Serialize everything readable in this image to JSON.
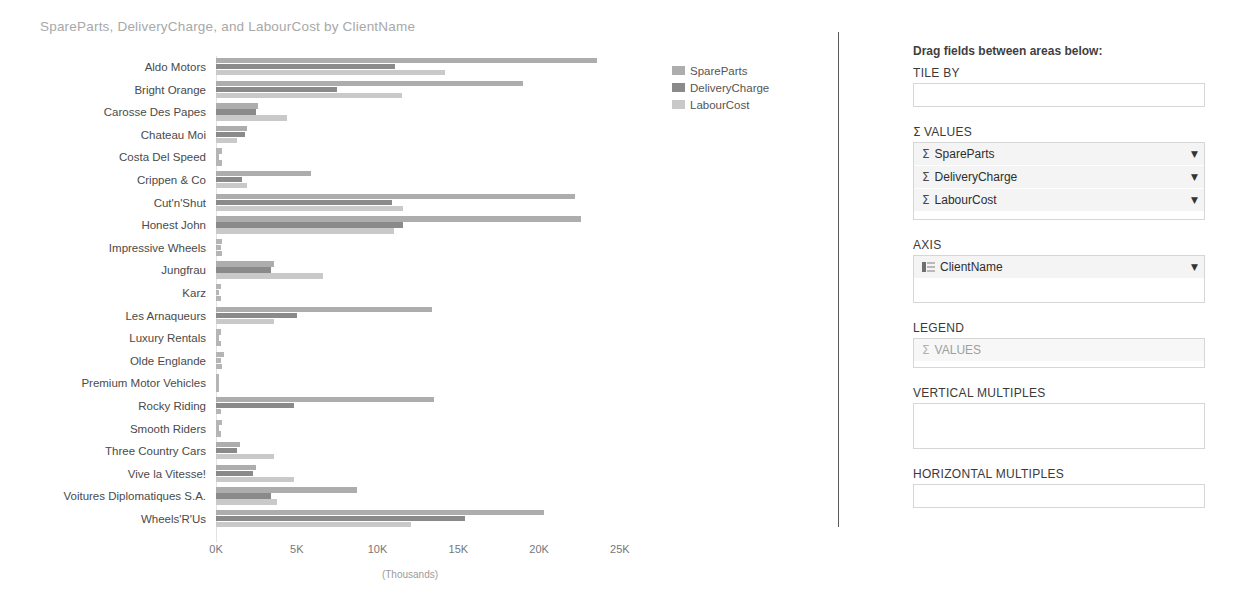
{
  "chart_data": {
    "type": "bar",
    "orientation": "horizontal",
    "title": "SpareParts, DeliveryCharge, and LabourCost by ClientName",
    "xlabel": "(Thousands)",
    "ylabel": "",
    "xlim": [
      0,
      26
    ],
    "xticks": [
      "0K",
      "5K",
      "10K",
      "15K",
      "20K",
      "25K"
    ],
    "xtick_values": [
      0,
      5,
      10,
      15,
      20,
      25
    ],
    "grid": false,
    "legend_position": "right",
    "categories": [
      "Aldo Motors",
      "Bright Orange",
      "Carosse Des Papes",
      "Chateau Moi",
      "Costa Del Speed",
      "Crippen & Co",
      "Cut'n'Shut",
      "Honest John",
      "Impressive Wheels",
      "Jungfrau",
      "Karz",
      "Les Arnaqueurs",
      "Luxury Rentals",
      "Olde Englande",
      "Premium Motor Vehicles",
      "Rocky Riding",
      "Smooth Riders",
      "Three Country Cars",
      "Vive la Vitesse!",
      "Voitures Diplomatiques S.A.",
      "Wheels'R'Us"
    ],
    "series": [
      {
        "name": "SpareParts",
        "color": "#adadad",
        "values": [
          23.6,
          19.0,
          2.6,
          1.9,
          0.4,
          5.9,
          22.2,
          22.6,
          0.4,
          3.6,
          0.3,
          13.4,
          0.3,
          0.5,
          0.1,
          13.5,
          0.4,
          1.5,
          2.5,
          8.7,
          20.3
        ]
      },
      {
        "name": "DeliveryCharge",
        "color": "#8a8a8a",
        "values": [
          11.1,
          7.5,
          2.5,
          1.8,
          0.2,
          1.6,
          10.9,
          11.6,
          0.3,
          3.4,
          0.2,
          5.0,
          0.2,
          0.3,
          0.1,
          4.8,
          0.2,
          1.3,
          2.3,
          3.4,
          15.4
        ]
      },
      {
        "name": "LabourCost",
        "color": "#c9c9c9",
        "values": [
          14.2,
          11.5,
          4.4,
          1.3,
          0.4,
          1.9,
          11.6,
          11.0,
          0.4,
          6.6,
          0.3,
          3.6,
          0.3,
          0.4,
          0.1,
          0.3,
          0.3,
          3.6,
          4.8,
          3.8,
          12.1
        ]
      }
    ]
  },
  "legend": {
    "items": [
      {
        "label": "SpareParts"
      },
      {
        "label": "DeliveryCharge"
      },
      {
        "label": "LabourCost"
      }
    ]
  },
  "fields_panel": {
    "hint": "Drag fields between areas below:",
    "wells": [
      {
        "label": "TILE BY",
        "has_sigma": false,
        "items": []
      },
      {
        "label": "VALUES",
        "has_sigma": true,
        "items": [
          {
            "icon": "sigma-icon",
            "glyph": "Σ",
            "label": "SpareParts",
            "caret": "▼",
            "muted": false
          },
          {
            "icon": "sigma-icon",
            "glyph": "Σ",
            "label": "DeliveryCharge",
            "caret": "▼",
            "muted": false
          },
          {
            "icon": "sigma-icon",
            "glyph": "Σ",
            "label": "LabourCost",
            "caret": "▼",
            "muted": false
          }
        ]
      },
      {
        "label": "AXIS",
        "has_sigma": false,
        "items": [
          {
            "icon": "field-list-icon",
            "glyph": "",
            "label": "ClientName",
            "caret": "▼",
            "muted": false
          }
        ]
      },
      {
        "label": "LEGEND",
        "has_sigma": false,
        "items": [
          {
            "icon": "sigma-icon",
            "glyph": "Σ",
            "label": "VALUES",
            "caret": "",
            "muted": true
          }
        ]
      },
      {
        "label": "VERTICAL MULTIPLES",
        "has_sigma": false,
        "items": []
      },
      {
        "label": "HORIZONTAL MULTIPLES",
        "has_sigma": false,
        "items": []
      }
    ]
  }
}
